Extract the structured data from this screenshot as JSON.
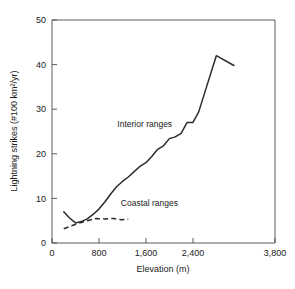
{
  "chart_data": {
    "type": "line",
    "title": "",
    "xlabel": "Elevation (m)",
    "ylabel": "Lightning strikes (#100 km2/yr)",
    "ylabel_display": "Lightning strikes (#100 km²/yr)",
    "xlim": [
      0,
      3800
    ],
    "ylim": [
      0,
      50
    ],
    "grid": false,
    "legend_position": "inline-annotations",
    "x_tick_labels": [
      "0",
      "800",
      "1,600",
      "2,400",
      "3,800"
    ],
    "x_tick_values": [
      0,
      800,
      1600,
      2400,
      3800
    ],
    "y_tick_labels": [
      "0",
      "10",
      "20",
      "30",
      "40",
      "50"
    ],
    "y_tick_values": [
      0,
      10,
      20,
      30,
      40,
      50
    ],
    "series": [
      {
        "name": "Interior ranges",
        "style": "solid",
        "color": "#2b2b2b",
        "x": [
          200,
          300,
          400,
          500,
          600,
          700,
          800,
          900,
          1000,
          1100,
          1200,
          1300,
          1400,
          1500,
          1600,
          1700,
          1800,
          1900,
          2000,
          2100,
          2200,
          2300,
          2400,
          2500,
          2600,
          2800,
          3100
        ],
        "values": [
          7.0,
          5.6,
          4.5,
          4.8,
          5.4,
          6.4,
          7.6,
          9.2,
          11.0,
          12.6,
          13.8,
          14.8,
          16.0,
          17.2,
          18.0,
          19.4,
          21.0,
          21.8,
          23.4,
          23.8,
          24.6,
          27.0,
          27.0,
          29.4,
          33.6,
          42.0,
          39.8
        ]
      },
      {
        "name": "Coastal ranges",
        "style": "dashed",
        "color": "#2b2b2b",
        "x": [
          200,
          320,
          450,
          600,
          750,
          900,
          1050,
          1180,
          1300
        ],
        "values": [
          3.2,
          3.8,
          4.4,
          5.0,
          5.5,
          5.4,
          5.5,
          5.2,
          5.3
        ]
      }
    ],
    "annotations": [
      {
        "text": "Interior ranges",
        "x": 1580,
        "y": 26.0
      },
      {
        "text": "Coastal ranges",
        "x": 1660,
        "y": 8.2
      }
    ]
  }
}
